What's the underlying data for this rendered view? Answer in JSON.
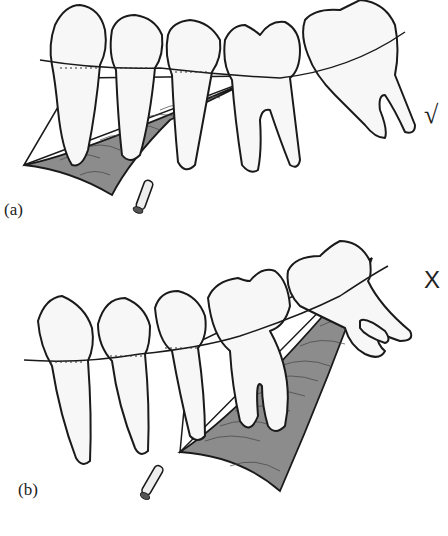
{
  "figure": {
    "panels": [
      {
        "id": "a",
        "label": "(a)",
        "verdict_symbol": "√",
        "verdict_meaning": "correct"
      },
      {
        "id": "b",
        "label": "(b)",
        "verdict_symbol": "X",
        "verdict_meaning": "incorrect"
      }
    ]
  }
}
